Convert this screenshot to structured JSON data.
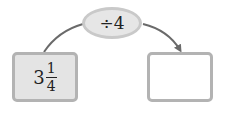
{
  "diagram": {
    "start_value": {
      "whole": "3",
      "numerator": "1",
      "denominator": "4"
    },
    "operation": "÷4",
    "result_value": "",
    "colors": {
      "box_fill": "#e4e4e4",
      "box_border": "#b3b3b3",
      "oval_fill": "#e6e6e6",
      "oval_border": "#c9c9c9",
      "arrow": "#6a6a6a"
    }
  }
}
